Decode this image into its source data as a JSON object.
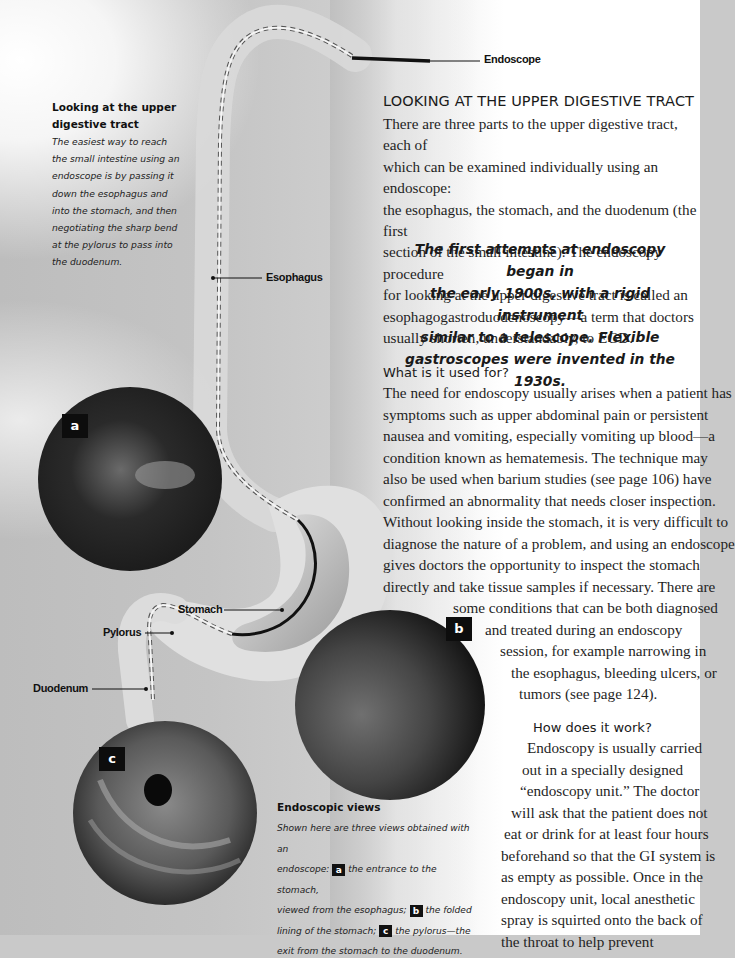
{
  "labels": {
    "endoscope": "Endoscope",
    "esophagus": "Esophagus",
    "stomach": "Stomach",
    "pylorus": "Pylorus",
    "duodenum": "Duodenum"
  },
  "sidebar": {
    "title_line1": "Looking at the upper",
    "title_line2": "digestive tract",
    "body_lines": [
      "The easiest way to reach",
      "the small intestine using an",
      "endoscope is by passing it",
      "down the esophagus and",
      "into the stomach, and then",
      "negotiating the sharp bend",
      "at the pylorus to pass into",
      "the duodenum."
    ]
  },
  "article": {
    "heading": "LOOKING AT THE UPPER DIGESTIVE TRACT",
    "intro_lines": [
      "There are three parts to the upper digestive tract, each of",
      "which can be examined individually using an endoscope:",
      "the esophagus, the stomach, and the duodenum (the first",
      "section of the small intestine). The endoscopy procedure",
      "for looking at the upper digestive tract is called an",
      "esophagogastroduodenoscopy—a term that doctors",
      "usually shorten, understandably, to EGD."
    ],
    "pull_quote_lines": [
      "The first attempts at endoscopy began in",
      "the early 1900s, with a rigid instrument",
      "similar to a telescope. Flexible",
      "gastroscopes were invented in the 1930s."
    ],
    "section1": {
      "heading": "What is it used for?",
      "lines": [
        "The need for endoscopy usually arises when a patient has",
        "symptoms such as upper abdominal pain or persistent",
        "nausea and vomiting, especially vomiting up blood—a",
        "condition known as hematemesis. The technique may",
        "also be used when barium studies (see page 106) have",
        "confirmed an abnormality that needs closer inspection.",
        "Without looking inside the stomach, it is very difficult to",
        "diagnose the nature of a problem, and using an endoscope",
        "gives doctors the opportunity to inspect the stomach",
        "directly and take tissue samples if necessary. There are",
        "some conditions that can be both diagnosed",
        "and treated during an endoscopy",
        "session, for example narrowing in",
        "the esophagus, bleeding ulcers, or",
        "tumors (see page 124)."
      ]
    },
    "section2": {
      "heading": "How does it work?",
      "lines": [
        "Endoscopy is usually carried",
        "out in a specially designed",
        "“endoscopy unit.” The doctor",
        "will ask that the patient does not",
        "eat or drink for at least four hours",
        "beforehand so that the GI system is",
        "as empty as possible. Once in the",
        "endoscopy unit, local anesthetic",
        "spray is squirted onto the back of",
        "the throat to help prevent",
        "discomfort as the endoscope is",
        "passed down. The patient can"
      ]
    }
  },
  "views": {
    "badge_a": "a",
    "badge_b": "b",
    "badge_c": "c"
  },
  "caption": {
    "title": "Endoscopic views",
    "line1": "Shown here are three views obtained with an",
    "line2_pre": "endoscope:",
    "line2_badge": "a",
    "line2_post": "the entrance to the stomach,",
    "line3_pre": "viewed from the esophagus;",
    "line3_badge": "b",
    "line3_post": "the folded",
    "line4_pre": "lining of the stomach;",
    "line4_badge": "c",
    "line4_post": "the pylorus—the",
    "line5": "exit from the stomach to the duodenum."
  }
}
